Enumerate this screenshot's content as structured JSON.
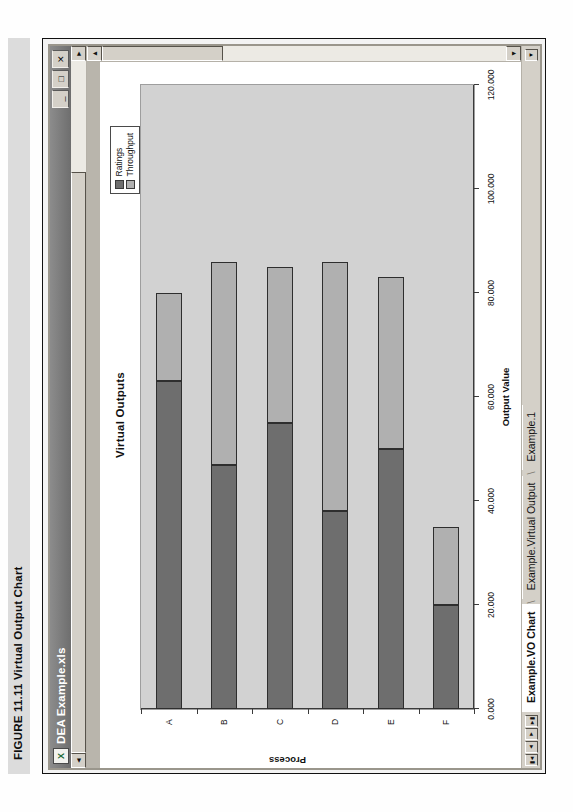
{
  "figure": {
    "caption": "FIGURE 11.11  Virtual Output Chart"
  },
  "window": {
    "title": "DEA Example.xls",
    "app_icon": "excel-icon",
    "controls": {
      "minimize_label": "_",
      "maximize_label": "□",
      "close_label": "✕"
    },
    "scrollbars": {
      "left_arrow": "◄",
      "right_arrow": "►",
      "up_arrow": "▲",
      "down_arrow": "▼"
    }
  },
  "sheet_tabs": {
    "nav": {
      "first": "▮◄",
      "prev": "◄",
      "next": "►",
      "last": "►▮",
      "dropdown": "▼"
    },
    "items": [
      {
        "label": "Example.VO Chart",
        "active": true
      },
      {
        "label": "Example.Virtual Output",
        "active": false
      },
      {
        "label": "Example.1",
        "active": false
      }
    ]
  },
  "colors": {
    "ratings": "#6e6e6e",
    "throughput": "#b0b0b0",
    "plot_bg": "#d2d2d2",
    "chart_bg": "#ffffff",
    "window_face": "#d4d0c8"
  },
  "chart_data": {
    "type": "bar",
    "orientation": "horizontal",
    "stacked": true,
    "title": "Virtual Outputs",
    "xlabel": "Output Value",
    "ylabel": "Process",
    "categories": [
      "A",
      "B",
      "C",
      "D",
      "E",
      "F"
    ],
    "series": [
      {
        "name": "Ratings",
        "values": [
          63.0,
          47.0,
          55.0,
          38.0,
          50.0,
          20.0
        ]
      },
      {
        "name": "Throughput",
        "values": [
          17.0,
          39.0,
          30.0,
          48.0,
          33.0,
          15.0
        ]
      }
    ],
    "totals": [
      80.0,
      86.0,
      85.0,
      86.0,
      83.0,
      35.0
    ],
    "xlim": [
      0,
      120
    ],
    "xticks": [
      0,
      20,
      40,
      60,
      80,
      100,
      120
    ],
    "xticklabels": [
      "0.000",
      "20.000",
      "40.000",
      "60.000",
      "80.000",
      "100.000",
      "120.000"
    ],
    "grid": false,
    "legend_position": "top-right",
    "legend": [
      "Ratings",
      "Throughput"
    ]
  }
}
